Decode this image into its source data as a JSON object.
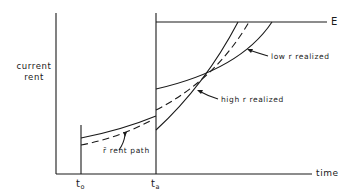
{
  "diagram": {
    "y_axis_label_line1": "current",
    "y_axis_label_line2": "rent",
    "x_axis_label": "time",
    "ceiling_label": "E",
    "t0_label": "t",
    "t0_sub": "o",
    "ta_label": "t",
    "ta_sub": "a",
    "low_r_label": "low  r  realized",
    "high_r_label": "high  r  realized",
    "rbar_path_label": "r̄  rent  path",
    "colors": {
      "ink": "#1a1a1a",
      "background": "#ffffff"
    }
  }
}
